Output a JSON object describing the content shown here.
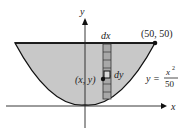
{
  "diagram": {
    "axes": {
      "x_label": "x",
      "y_label": "y"
    },
    "point_label": "(50, 50)",
    "strip_label": "dx",
    "cell_label": "dy",
    "generic_point_label": "(x, y)",
    "equation": {
      "lhs": "y =",
      "numerator": "x",
      "exponent": "2",
      "denominator": "50"
    },
    "colors": {
      "fill": "#c8c8c8",
      "stroke": "#111111",
      "strip": "#a8a8a8"
    }
  }
}
